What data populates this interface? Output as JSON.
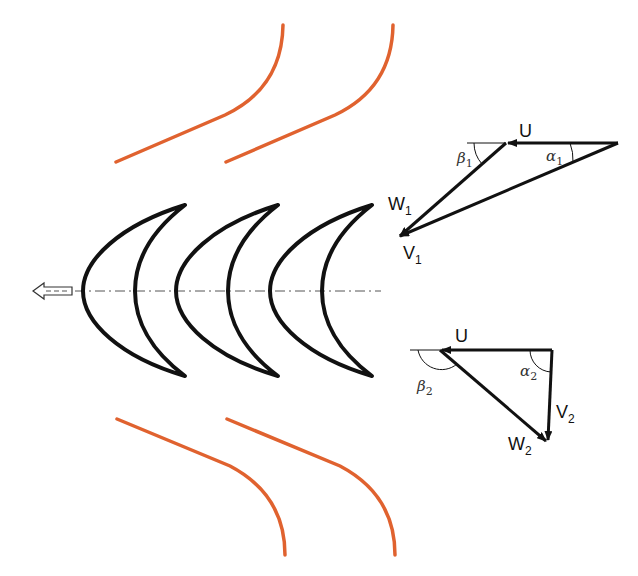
{
  "diagram": {
    "type": "turbine blade cascade with velocity triangles",
    "colors": {
      "blade_stroke": "#111111",
      "casing_curve": "#e0622f",
      "vector": "#111111",
      "centerline": "#555555",
      "background": "#ffffff"
    },
    "blades": {
      "count": 3,
      "tip_x": [
        185,
        278,
        372
      ]
    },
    "casing_curves": {
      "count": 4
    },
    "flow_arrow": {
      "direction": "left"
    },
    "inlet_triangle": {
      "labels": {
        "u": "U",
        "w": "W",
        "w_sub": "1",
        "v": "V",
        "v_sub": "1",
        "alpha": "α",
        "alpha_sub": "1",
        "beta": "β",
        "beta_sub": "1"
      }
    },
    "outlet_triangle": {
      "labels": {
        "u": "U",
        "w": "W",
        "w_sub": "2",
        "v": "V",
        "v_sub": "2",
        "alpha": "α",
        "alpha_sub": "2",
        "beta": "β",
        "beta_sub": "2"
      }
    }
  }
}
